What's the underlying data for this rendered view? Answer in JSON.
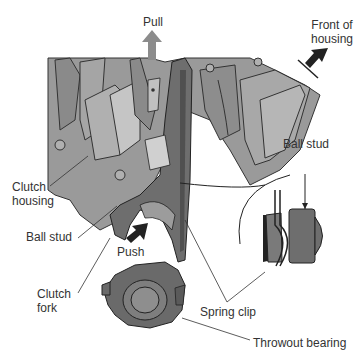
{
  "diagram": {
    "colors": {
      "housing": "#9a9a9a",
      "housing_dark": "#7a7a7a",
      "fork": "#6e6e6e",
      "arrow_pull": "#8c8c8c",
      "arrow_dark": "#222222",
      "line": "#333333",
      "background": "#ffffff"
    },
    "labels": {
      "pull": "Pull",
      "front_of_housing_line1": "Front of",
      "front_of_housing_line2": "housing",
      "ball_stud_detail": "Ball stud",
      "clutch_housing_line1": "Clutch",
      "clutch_housing_line2": "housing",
      "ball_stud": "Ball stud",
      "push": "Push",
      "clutch_fork_line1": "Clutch",
      "clutch_fork_line2": "fork",
      "spring_clip": "Spring clip",
      "throwout_bearing": "Throwout bearing"
    }
  }
}
